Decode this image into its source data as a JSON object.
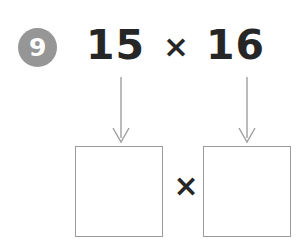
{
  "page": {
    "background_color": "#ffffff",
    "width": 301,
    "height": 242
  },
  "question": {
    "number": "9",
    "badge_color": "#969696",
    "badge_text_color": "#ffffff"
  },
  "expression": {
    "left_factor": "15",
    "operator": "×",
    "right_factor": "16",
    "text_color": "#262626"
  },
  "arrows": {
    "color": "#9e9e9e",
    "items": [
      {
        "name": "arrow-left",
        "from": "15",
        "to": "answer-box-left"
      },
      {
        "name": "arrow-right",
        "from": "16",
        "to": "answer-box-right"
      }
    ]
  },
  "answer": {
    "box_border_color": "#9b9b9b",
    "box_fill_color": "#ffffff",
    "left_box_value": "",
    "right_box_value": "",
    "operator": "×",
    "operator_color": "#262626"
  },
  "icons": {
    "arrow-down-icon": "↓",
    "multiply-icon": "×"
  }
}
